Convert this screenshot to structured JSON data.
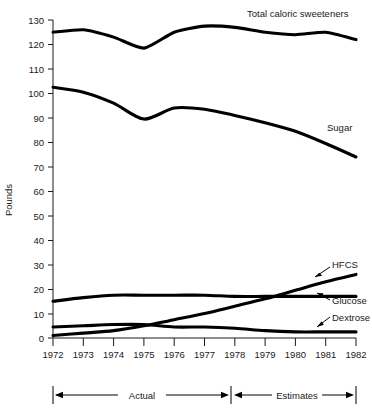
{
  "chart_data": {
    "type": "line",
    "title": "",
    "xlabel": "",
    "ylabel": "Pounds",
    "xlim": [
      1972,
      1982
    ],
    "ylim": [
      0,
      130
    ],
    "grid": false,
    "legend_position": "inline-right-labels",
    "x": [
      1972,
      1973,
      1974,
      1975,
      1976,
      1977,
      1978,
      1979,
      1980,
      1981,
      1982
    ],
    "xtick_labels": [
      "1972",
      "1973",
      "1974",
      "1975",
      "1976",
      "1977",
      "1978",
      "1979",
      "1980",
      "1981",
      "1982"
    ],
    "ytick_labels": [
      "0",
      "10",
      "20",
      "30",
      "40",
      "50",
      "60",
      "70",
      "80",
      "90",
      "100",
      "110",
      "120",
      "130"
    ],
    "ytick_values": [
      0,
      10,
      20,
      30,
      40,
      50,
      60,
      70,
      80,
      90,
      100,
      110,
      120,
      130
    ],
    "series": [
      {
        "name": "Total caloric sweeteners",
        "label": "Total caloric sweeteners",
        "values": [
          125.0,
          126.0,
          123.0,
          118.5,
          125.0,
          127.5,
          127.0,
          125.0,
          124.0,
          125.0,
          122.0
        ]
      },
      {
        "name": "Sugar",
        "label": "Sugar",
        "values": [
          102.5,
          100.5,
          96.0,
          89.5,
          94.0,
          93.5,
          91.0,
          88.0,
          84.5,
          79.5,
          74.0
        ]
      },
      {
        "name": "HFCS",
        "label": "HFCS",
        "values": [
          1.0,
          2.0,
          3.0,
          5.0,
          7.5,
          10.0,
          13.0,
          16.0,
          19.5,
          23.0,
          26.0
        ]
      },
      {
        "name": "Glucose",
        "label": "Glucose",
        "values": [
          15.0,
          16.5,
          17.5,
          17.5,
          17.5,
          17.5,
          17.0,
          17.0,
          17.0,
          17.0,
          17.0
        ]
      },
      {
        "name": "Dextrose",
        "label": "Dextrose",
        "values": [
          4.5,
          5.0,
          5.5,
          5.5,
          4.5,
          4.5,
          4.0,
          3.0,
          2.5,
          2.5,
          2.5
        ]
      }
    ],
    "annotations": [
      {
        "text": "Actual",
        "from_year": 1972,
        "to_year": 1978
      },
      {
        "text": "Estimates",
        "from_year": 1978,
        "to_year": 1982
      }
    ]
  },
  "axis": {
    "y_title": "Pounds"
  },
  "labels": {
    "total": "Total caloric sweeteners",
    "sugar": "Sugar",
    "hfcs": "HFCS",
    "glucose": "Glucose",
    "dextrose": "Dextrose"
  },
  "ticks": {
    "y": [
      "130",
      "120",
      "110",
      "100",
      "90",
      "80",
      "70",
      "60",
      "50",
      "40",
      "30",
      "20",
      "10",
      "0"
    ],
    "x": [
      "1972",
      "1973",
      "1974",
      "1975",
      "1976",
      "1977",
      "1978",
      "1979",
      "1980",
      "1981",
      "1982"
    ]
  },
  "bracket": {
    "actual": "Actual",
    "estimates": "Estimates"
  }
}
